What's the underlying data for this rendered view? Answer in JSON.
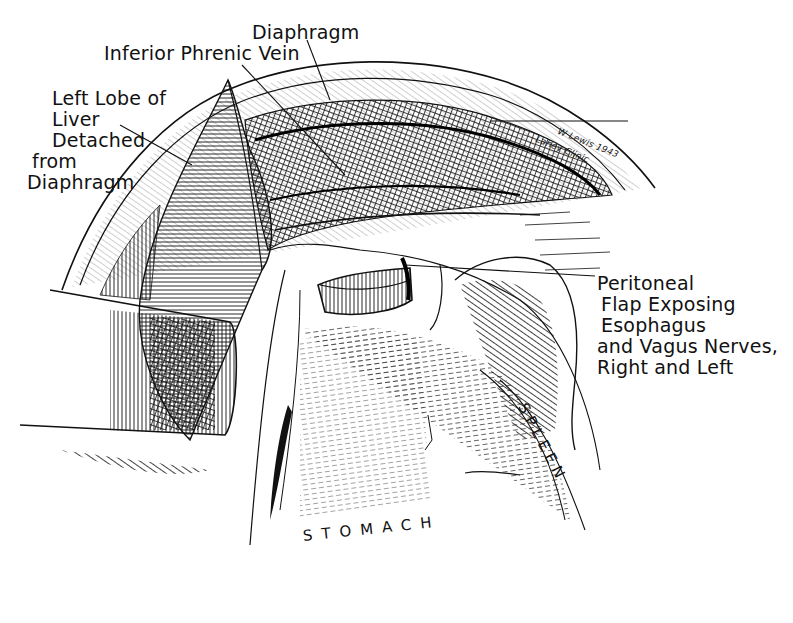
{
  "figure": {
    "type": "anatomical-illustration",
    "style": "black-and-white pen-and-ink line drawing",
    "background": "#ffffff",
    "ink": "#111111"
  },
  "labels": {
    "diaphragm_top": "Diaphragm",
    "inferior_phrenic_vein": "Inferior Phrenic Vein",
    "left_lobe": [
      "Left Lobe of",
      "Liver",
      "Detached",
      "from",
      "Diaphragm"
    ],
    "peritoneal_flap": [
      "Peritoneal",
      "Flap Exposing",
      "Esophagus",
      "and Vagus Nerves,",
      "Right and Left"
    ],
    "spleen": "SPLEEN",
    "stomach": "STOMACH"
  },
  "signature": {
    "line1": "W Lewis 1943",
    "line2": "Lahey Clinic"
  }
}
